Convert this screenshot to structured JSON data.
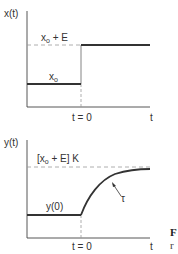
{
  "diagram": {
    "top_plot": {
      "y_axis_label": "x(t)",
      "x_axis_label": "t",
      "step_time_label": "t = 0",
      "upper_level_label": {
        "base": "x",
        "sub": "o",
        "suffix": " + E"
      },
      "lower_level_label": {
        "base": "x",
        "sub": "o"
      }
    },
    "bottom_plot": {
      "y_axis_label": "y(t)",
      "x_axis_label": "t",
      "step_time_label": "t = 0",
      "final_value_label": {
        "prefix": "[x",
        "sub": "o",
        "suffix": " + E] K"
      },
      "initial_value_label": "y(0)",
      "time_constant_label": "τ"
    },
    "caption_fragment": {
      "line1": "F",
      "line2": "r"
    }
  },
  "colors": {
    "ink": "#333333",
    "dashed": "#999999",
    "background": "#ffffff"
  }
}
